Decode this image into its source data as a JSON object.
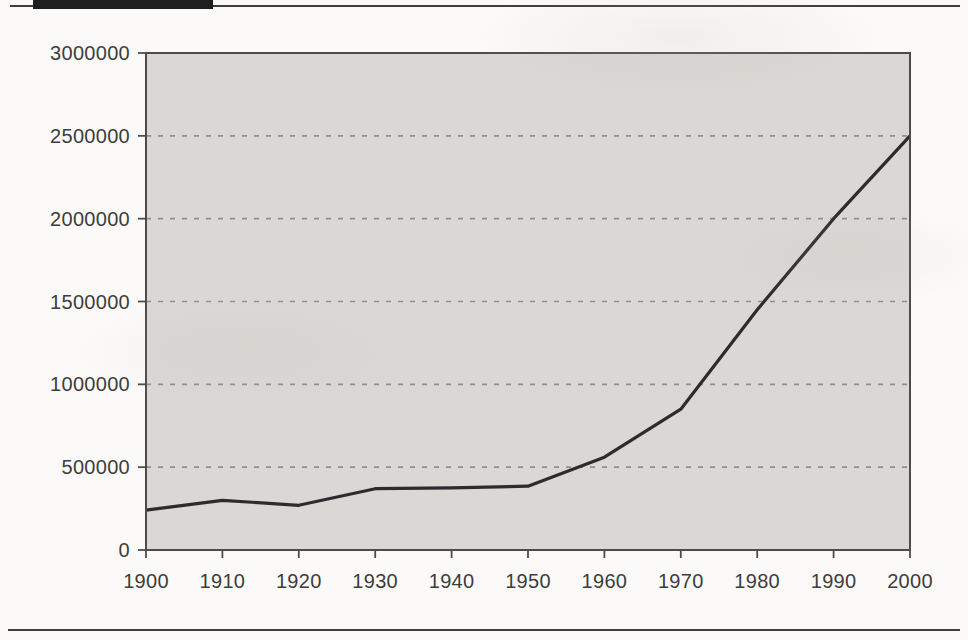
{
  "page": {
    "background_color": "#fbfaf8",
    "header_bar_color": "#1f1f1f",
    "rule_color": "#3d3d3d"
  },
  "chart_data": {
    "type": "line",
    "x": [
      1900,
      1910,
      1920,
      1930,
      1940,
      1950,
      1960,
      1970,
      1980,
      1990,
      2000
    ],
    "series": [
      {
        "name": "population",
        "values": [
          240000,
          300000,
          270000,
          370000,
          375000,
          385000,
          560000,
          850000,
          1450000,
          2000000,
          2500000
        ]
      }
    ],
    "title": "",
    "xlabel": "",
    "ylabel": "",
    "ylim": [
      0,
      3000000
    ],
    "ytick_step": 500000,
    "y_tick_labels": [
      "0",
      "500000",
      "1000000",
      "1500000",
      "2000000",
      "2500000",
      "3000000"
    ],
    "x_tick_labels": [
      "1900",
      "1910",
      "1920",
      "1930",
      "1940",
      "1950",
      "1960",
      "1970",
      "1980",
      "1990",
      "2000"
    ],
    "grid": "horizontal-dashed",
    "legend": "none",
    "plot_background_color": "#d9d8d4",
    "line_color": "#2c2c2c",
    "grid_line_color": "#8f8f8f",
    "frame_color": "#4c4c4c",
    "tick_label_color": "#3d3d3d"
  }
}
